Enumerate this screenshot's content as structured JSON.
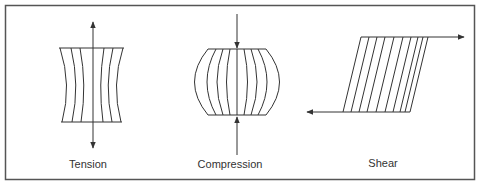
{
  "diagram": {
    "panels": [
      {
        "id": "tension",
        "label": "Tension",
        "description": "Body stretched by opposing outward forces; sides narrow inward"
      },
      {
        "id": "compression",
        "label": "Compression",
        "description": "Body squeezed by opposing inward forces; sides bulge outward"
      },
      {
        "id": "shear",
        "label": "Shear",
        "description": "Opposite parallel forces slide top and bottom faces past each other"
      }
    ]
  },
  "colors": {
    "frame": "#555555",
    "line": "#333333",
    "background": "#ffffff"
  }
}
